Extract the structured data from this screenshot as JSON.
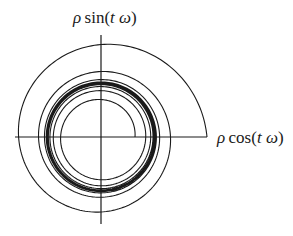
{
  "diagram": {
    "type": "polar-spiral-phase-portrait",
    "labels": {
      "y_axis": {
        "rho": "ρ",
        "func": "sin(",
        "t": "t",
        "omega": " ω",
        "close": ")",
        "full": "ρ sin(t ω)"
      },
      "x_axis": {
        "rho": "ρ",
        "func": "cos(",
        "t": "t",
        "omega": " ω",
        "close": ")",
        "full": "ρ cos(t ω)"
      }
    },
    "center": [
      101,
      137
    ],
    "axes": {
      "horizontal": {
        "x1": 15,
        "x2": 207,
        "y": 137
      },
      "vertical": {
        "x": 101,
        "y1": 35,
        "y2": 224
      }
    },
    "spiral": {
      "start_radius": 106,
      "limit_cycle_radius": 54,
      "inner_start_radius": 34,
      "outer_decay": 0.55,
      "inner_growth": 0.35,
      "outer_turns": 9,
      "inner_turns": 9,
      "stroke_color": "#1a1a1a",
      "stroke_width": 1.1
    },
    "colors": {
      "line": "#1a1a1a",
      "background": "#ffffff"
    }
  }
}
